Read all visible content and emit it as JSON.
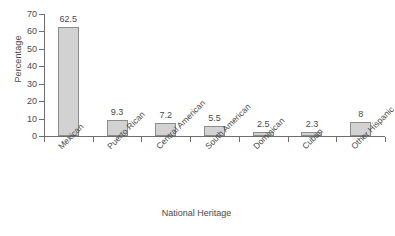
{
  "chart_data": {
    "type": "bar",
    "title": "",
    "xlabel": "National Heritage",
    "ylabel": "Percentage",
    "categories": [
      "Mexican",
      "Puerto Rican",
      "Central American",
      "South American",
      "Dominican",
      "Cuban",
      "Other Hispanic"
    ],
    "values": [
      62.5,
      9.3,
      7.2,
      5.5,
      2.5,
      2.3,
      8
    ],
    "value_labels": [
      "62.5",
      "9.3",
      "7.2",
      "5.5",
      "2.5",
      "2.3",
      "8"
    ],
    "ylim": [
      0,
      70
    ],
    "y_ticks": [
      0,
      10,
      20,
      30,
      40,
      50,
      60,
      70
    ],
    "y_tick_labels": [
      "0",
      "10",
      "20",
      "30",
      "40",
      "50",
      "60",
      "70"
    ],
    "grid": false,
    "legend": false,
    "legend_position": "none",
    "bar_fill_color": "#d2d2d2",
    "bar_border_color": "#8d8d8d",
    "axis_color": "#6e6e6e",
    "text_color": "#4a4a4a",
    "background_color": "#ffffff"
  }
}
